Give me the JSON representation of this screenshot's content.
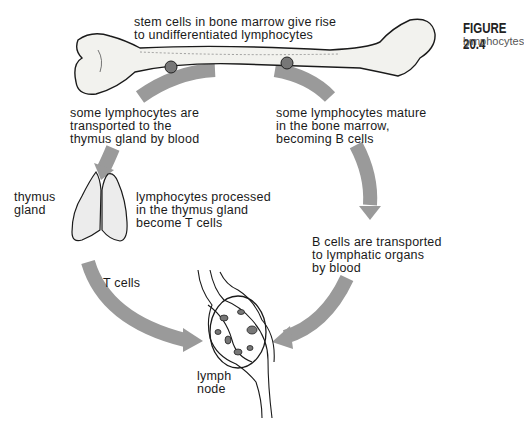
{
  "figure": {
    "number": "FIGURE 20.4",
    "caption": "lymphocytes"
  },
  "labels": {
    "stem_cells": "stem cells in bone marrow give rise\nto undifferentiated lymphocytes",
    "thymus_transport": "some lymphocytes are\ntransported to the\nthymus gland by blood",
    "bone_marrow_mature": "some lymphocytes mature\nin the bone marrow,\nbecoming B cells",
    "thymus_gland": "thymus\ngland",
    "t_processing": "lymphocytes processed\nin the thymus gland\nbecome T cells",
    "b_transport": "B cells are transported\nto lymphatic organs\nby blood",
    "t_cells": "T cells",
    "lymph_node": "lymph\nnode"
  },
  "structures": {
    "bone": "femur (bone marrow)",
    "thymus": "thymus gland",
    "node": "lymph node"
  },
  "colors": {
    "arrow": "#9a9a9a",
    "ink": "#1a1a1a",
    "bone_fill": "#f2f2ee",
    "marrow_spot": "#777777"
  }
}
